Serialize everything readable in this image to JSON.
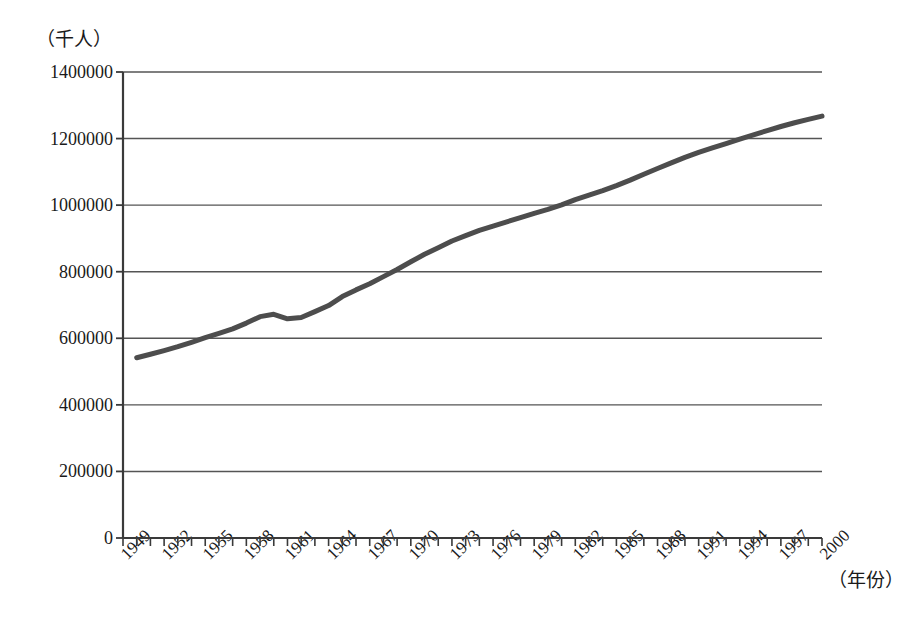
{
  "chart_data": {
    "type": "line",
    "title": "",
    "subtitle": "",
    "xlabel": "（年份）",
    "ylabel": "（千人）",
    "xlim": [
      1949,
      2000
    ],
    "ylim": [
      0,
      1400000
    ],
    "grid": true,
    "legend": null,
    "y_ticks": [
      1400000,
      1200000,
      1000000,
      800000,
      600000,
      400000,
      200000,
      0
    ],
    "y_tick_labels": [
      "1400000",
      "1200000",
      "1000000",
      "800000",
      "600000",
      "400000",
      "200000",
      "0"
    ],
    "x_ticks": [
      1949,
      1952,
      1955,
      1958,
      1961,
      1964,
      1967,
      1970,
      1973,
      1976,
      1979,
      1982,
      1985,
      1988,
      1991,
      1994,
      1997,
      2000
    ],
    "x_tick_labels": [
      "1949",
      "1952",
      "1955",
      "1958",
      "1961",
      "1964",
      "1967",
      "1970",
      "1973",
      "1976",
      "1979",
      "1982",
      "1985",
      "1988",
      "1991",
      "1994",
      "1997",
      "2000"
    ],
    "line_color": "#4d4d4d",
    "line_width": 5,
    "series": [
      {
        "name": "人口",
        "x": [
          1950,
          1951,
          1952,
          1953,
          1954,
          1955,
          1956,
          1957,
          1958,
          1959,
          1960,
          1961,
          1962,
          1963,
          1964,
          1965,
          1966,
          1967,
          1968,
          1969,
          1970,
          1971,
          1972,
          1973,
          1974,
          1975,
          1976,
          1977,
          1978,
          1979,
          1980,
          1981,
          1982,
          1983,
          1984,
          1985,
          1986,
          1987,
          1988,
          1989,
          1990,
          1991,
          1992,
          1993,
          1994,
          1995,
          1996,
          1997,
          1998,
          1999,
          2000
        ],
        "values": [
          541670,
          551960,
          563000,
          574820,
          587960,
          601930,
          614650,
          628290,
          645630,
          665000,
          672070,
          658590,
          662590,
          680000,
          698350,
          725380,
          745420,
          763680,
          785340,
          806710,
          829920,
          852290,
          871770,
          892110,
          908590,
          924200,
          937170,
          949740,
          962590,
          975420,
          987050,
          1000720,
          1016540,
          1030080,
          1043570,
          1058510,
          1075070,
          1093000,
          1110260,
          1127040,
          1143330,
          1158230,
          1171710,
          1185170,
          1198500,
          1211210,
          1223890,
          1236260,
          1247610,
          1257860,
          1267430
        ]
      }
    ],
    "annotations": [
      {
        "text": "1959–1961 人口下降",
        "x": 1960,
        "y": 660000,
        "visible": false
      }
    ]
  },
  "plot": {
    "frame_color": "#3a3a3a",
    "gridline_color": "#555555",
    "background": "#ffffff"
  }
}
